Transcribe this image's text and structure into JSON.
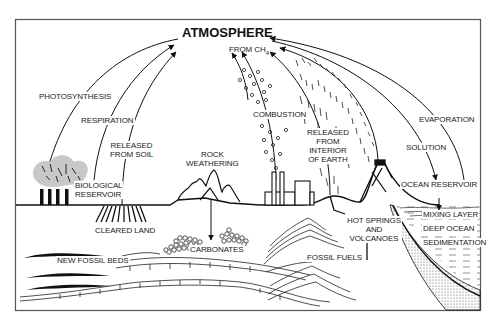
{
  "diagram": {
    "type": "carbon-cycle",
    "title": "ATMOSPHERE",
    "nodes": {
      "atmosphere": "ATMOSPHERE",
      "biological_reservoir": [
        "BIOLOGICAL",
        "RESERVOIR"
      ],
      "cleared_land": "CLEARED LAND",
      "rock_weathering": [
        "ROCK",
        "WEATHERING"
      ],
      "carbonates": "CARBONATES",
      "new_fossil_beds": "NEW FOSSIL BEDS",
      "fossil_fuels": "FOSSIL FUELS",
      "hot_springs_volcanoes": [
        "HOT SPRINGS",
        "AND",
        "VOLCANOES"
      ],
      "ocean_reservoir": "OCEAN RESERVOIR",
      "mixing_layer": "MIXING LAYER",
      "deep_ocean": "DEEP OCEAN",
      "sedimentation": "SEDIMENTATION"
    },
    "flows": {
      "photosynthesis": "PHOTOSYNTHESIS",
      "respiration": "RESPIRATION",
      "released_from_soil": [
        "RELEASED",
        "FROM SOIL"
      ],
      "from_ch4_prefix": "FROM CH",
      "from_ch4_subscript": "4",
      "combustion": "COMBUSTION",
      "released_from_interior": [
        "RELEASED",
        "FROM",
        "INTERIOR",
        "OF EARTH"
      ],
      "evaporation": "EVAPORATION",
      "solution": "SOLUTION"
    },
    "edges": [
      {
        "from": "atmosphere",
        "to": "biological_reservoir",
        "label": "PHOTOSYNTHESIS"
      },
      {
        "from": "biological_reservoir",
        "to": "atmosphere",
        "label": "RESPIRATION"
      },
      {
        "from": "cleared_land",
        "to": "atmosphere",
        "label": "RELEASED FROM SOIL"
      },
      {
        "from": "rock_weathering",
        "to": "carbonates",
        "label": ""
      },
      {
        "from": "combustion",
        "to": "atmosphere",
        "label": "FROM CH4"
      },
      {
        "from": "fossil_fuels",
        "to": "atmosphere",
        "label": "COMBUSTION"
      },
      {
        "from": "hot_springs_volcanoes",
        "to": "atmosphere",
        "label": "RELEASED FROM INTERIOR OF EARTH"
      },
      {
        "from": "ocean_reservoir",
        "to": "atmosphere",
        "label": "EVAPORATION"
      },
      {
        "from": "atmosphere",
        "to": "ocean_reservoir",
        "label": "SOLUTION"
      },
      {
        "from": "ocean_reservoir",
        "to": "mixing_layer",
        "label": ""
      }
    ],
    "colors": {
      "ink": "#1a1a1a",
      "tree_canopy": "#c8c8c8",
      "paper": "#ffffff",
      "frame": "#555555"
    }
  }
}
